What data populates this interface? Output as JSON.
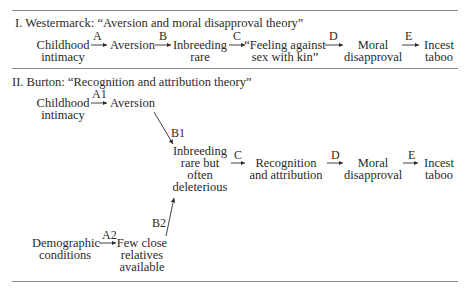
{
  "section1": {
    "heading": "I.  Westermarck: “Aversion and moral disapproval theory”",
    "nodes": {
      "n1": [
        "Childhood",
        "intimacy"
      ],
      "n2": [
        "Aversion"
      ],
      "n3": [
        "Inbreeding",
        "rare"
      ],
      "n4": [
        "“Feeling against",
        "sex with kin”"
      ],
      "n5": [
        "Moral",
        "disapproval"
      ],
      "n6": [
        "Incest",
        "taboo"
      ]
    },
    "edges": [
      "A",
      "B",
      "C",
      "D",
      "E"
    ]
  },
  "section2": {
    "heading": "II.  Burton: “Recognition and attribution theory”",
    "nodes": {
      "childhood": [
        "Childhood",
        "intimacy"
      ],
      "aversion": [
        "Aversion"
      ],
      "inbreeding": [
        "Inbreeding",
        "rare but",
        "often",
        "deleterious"
      ],
      "recognition": [
        "Recognition",
        "and attribution"
      ],
      "moral": [
        "Moral",
        "disapproval"
      ],
      "incest": [
        "Incest",
        "taboo"
      ],
      "demographic": [
        "Demographic",
        "conditions"
      ],
      "few": [
        "Few  close",
        "relatives",
        "available"
      ]
    },
    "edges": {
      "A1": "A1",
      "B1": "B1",
      "C": "C",
      "D": "D",
      "E": "E",
      "A2": "A2",
      "B2": "B2"
    }
  }
}
